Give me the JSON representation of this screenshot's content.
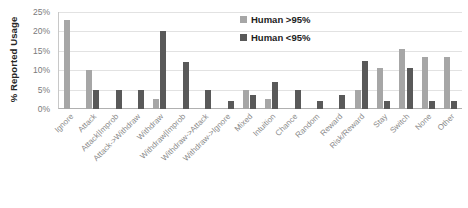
{
  "chart_data": {
    "type": "bar",
    "title": "",
    "xlabel": "",
    "ylabel": "% Reported Usage",
    "ylim": [
      0,
      25
    ],
    "ytick_labels": [
      "25%",
      "20%",
      "15%",
      "10%",
      "5%",
      "0%"
    ],
    "ytick_values": [
      25,
      20,
      15,
      10,
      5,
      0
    ],
    "grid": true,
    "legend_position": "top-right",
    "categories": [
      "Ignore",
      "Attack",
      "Attack|Improb",
      "Attack->Withdraw",
      "Withdraw",
      "Withdraw|Improb",
      "Withdraw->Attack",
      "Withdraw->Ignore",
      "Mixed",
      "Intuition",
      "Chance",
      "Random",
      "Reward",
      "Risk/Reward",
      "Stay",
      "Switch",
      "None",
      "Other"
    ],
    "series": [
      {
        "name": "Human >95%",
        "color": "#a6a6a6",
        "values": [
          23,
          10,
          0,
          0,
          2.5,
          0,
          0,
          0,
          5,
          2.5,
          0,
          0,
          0,
          5,
          10.5,
          15.5,
          13.5,
          13.5
        ]
      },
      {
        "name": "Human <95%",
        "color": "#595959",
        "values": [
          0,
          5,
          5,
          5,
          20,
          12,
          5,
          2,
          3.5,
          7,
          5,
          2,
          3.5,
          12.5,
          2,
          10.5,
          2,
          2
        ]
      }
    ]
  },
  "legend": {
    "items": [
      {
        "label": "Human >95%",
        "swatch": "light"
      },
      {
        "label": "Human <95%",
        "swatch": "dark"
      }
    ]
  }
}
